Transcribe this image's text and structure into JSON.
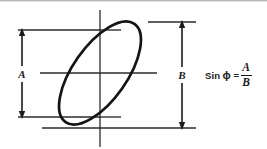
{
  "diagram": {
    "background_color": "#fefefe",
    "line_color": "#1a1a1a",
    "ellipse": {
      "center_x": 100,
      "center_y": 73,
      "semi_major": 60,
      "semi_minor": 27,
      "rotation_deg": -55,
      "stroke_width": 2.6
    },
    "vertical_axis": {
      "x": 100,
      "y_top": 10,
      "y_bottom": 147,
      "stroke_width": 1.3
    },
    "horizontal_center_line": {
      "y": 73,
      "x_start": 40,
      "x_end": 157,
      "stroke_width": 1.3
    },
    "reference_lines": [
      {
        "name": "a-top",
        "y": 30,
        "x_start": 18,
        "x_end": 100
      },
      {
        "name": "b-top",
        "y": 22,
        "x_start": 148,
        "x_end": 196
      },
      {
        "name": "a-bottom",
        "y": 117,
        "x_start": 18,
        "x_end": 100
      },
      {
        "name": "b-bottom",
        "y": 128,
        "x_start": 42,
        "x_end": 196
      }
    ],
    "axis_ticks": [
      {
        "name": "upper-crossing-tick",
        "y": 30,
        "x_start": 100,
        "x_end": 121
      },
      {
        "name": "lower-crossing-tick",
        "y": 117,
        "x_start": 100,
        "x_end": 121
      }
    ],
    "dimensions": [
      {
        "name": "amplitude-a",
        "label": "A",
        "x": 22,
        "y_top": 30,
        "y_bottom": 117,
        "label_x": 25,
        "label_y": 77
      },
      {
        "name": "amplitude-b",
        "label": "B",
        "x": 182,
        "y_top": 22,
        "y_bottom": 128,
        "label_x": 180,
        "label_y": 78
      }
    ]
  },
  "formula": {
    "sin_text": "Sin",
    "phi_symbol": "ϕ",
    "equals": "=",
    "numerator": "A",
    "denominator": "B",
    "full_text": "Sin ϕ = A/B"
  }
}
